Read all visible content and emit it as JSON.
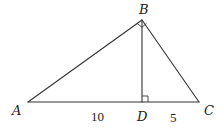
{
  "diagram": {
    "type": "right-triangle-with-altitude",
    "colors": {
      "stroke": "#333333",
      "text": "#222222",
      "background": "#ffffff"
    },
    "points": {
      "A": {
        "label": "A",
        "x": 28,
        "y": 102
      },
      "B": {
        "label": "B",
        "x": 142,
        "y": 20
      },
      "C": {
        "label": "C",
        "x": 199,
        "y": 102
      },
      "D": {
        "label": "D",
        "x": 142,
        "y": 102
      }
    },
    "segments": [
      {
        "from": "A",
        "to": "B"
      },
      {
        "from": "B",
        "to": "C"
      },
      {
        "from": "A",
        "to": "C"
      },
      {
        "from": "B",
        "to": "D"
      }
    ],
    "right_angles": [
      {
        "vertex": "B",
        "between": [
          "A",
          "C"
        ]
      },
      {
        "vertex": "D",
        "between": [
          "B",
          "C"
        ]
      }
    ],
    "lengths": {
      "AD": "10",
      "DC": "5"
    }
  }
}
